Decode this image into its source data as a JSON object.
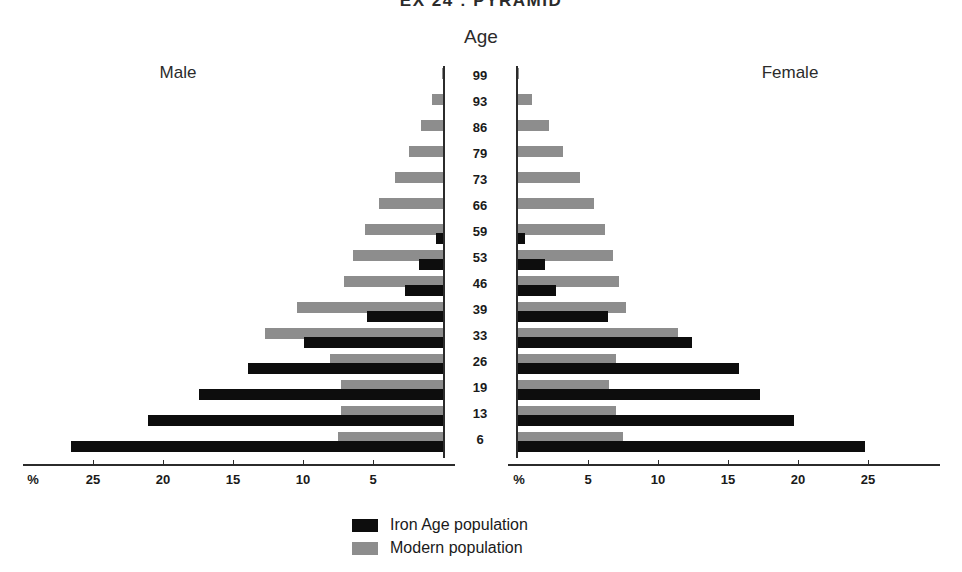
{
  "title": "EX 24 : PYRAMID",
  "axes": {
    "age_axis_title": "Age",
    "male_label": "Male",
    "female_label": "Female",
    "percent_symbol": "%",
    "x_ticks_male": [
      "25",
      "20",
      "15",
      "10",
      "5"
    ],
    "x_ticks_female": [
      "5",
      "10",
      "15",
      "20",
      "25"
    ],
    "age_ticks": [
      "99",
      "93",
      "86",
      "79",
      "73",
      "66",
      "59",
      "53",
      "46",
      "39",
      "33",
      "26",
      "19",
      "13",
      "6"
    ]
  },
  "legend": {
    "items": [
      {
        "label": "Iron Age population",
        "color": "#0d0d0d",
        "key": "iron"
      },
      {
        "label": "Modern population",
        "color": "#8d8d8d",
        "key": "modern"
      }
    ]
  },
  "colors": {
    "iron": "#0d0d0d",
    "modern": "#8d8d8d",
    "axis": "#2b2b2b",
    "background": "#ffffff"
  },
  "chart_data": {
    "type": "bar",
    "subtype": "population-pyramid",
    "title": "EX 24 : PYRAMID",
    "xlabel": "%",
    "ylabel": "Age",
    "xlim": [
      0,
      30
    ],
    "x_unit": "percent",
    "grid": false,
    "legend_position": "bottom-center",
    "categories": [
      "99",
      "93",
      "86",
      "79",
      "73",
      "66",
      "59",
      "53",
      "46",
      "39",
      "33",
      "26",
      "19",
      "13",
      "6"
    ],
    "series": [
      {
        "name": "Iron Age population",
        "side": "Male",
        "color": "#0d0d0d",
        "values": [
          0,
          0,
          0,
          0,
          0,
          0,
          0.5,
          1.7,
          2.7,
          5.4,
          9.9,
          13.9,
          17.4,
          21.1,
          26.6
        ]
      },
      {
        "name": "Modern population",
        "side": "Male",
        "color": "#8d8d8d",
        "values": [
          0.1,
          0.8,
          1.6,
          2.4,
          3.4,
          4.6,
          5.6,
          6.4,
          7.1,
          10.4,
          12.7,
          8.1,
          7.3,
          7.3,
          7.5
        ]
      },
      {
        "name": "Iron Age population",
        "side": "Female",
        "color": "#0d0d0d",
        "values": [
          0,
          0,
          0,
          0,
          0,
          0,
          0.5,
          1.9,
          2.7,
          6.4,
          12.4,
          15.8,
          17.3,
          19.7,
          24.8
        ]
      },
      {
        "name": "Modern population",
        "side": "Female",
        "color": "#8d8d8d",
        "values": [
          0.1,
          1.0,
          2.2,
          3.2,
          4.4,
          5.4,
          6.2,
          6.8,
          7.2,
          7.7,
          11.4,
          7.0,
          6.5,
          7.0,
          7.5
        ]
      }
    ]
  }
}
